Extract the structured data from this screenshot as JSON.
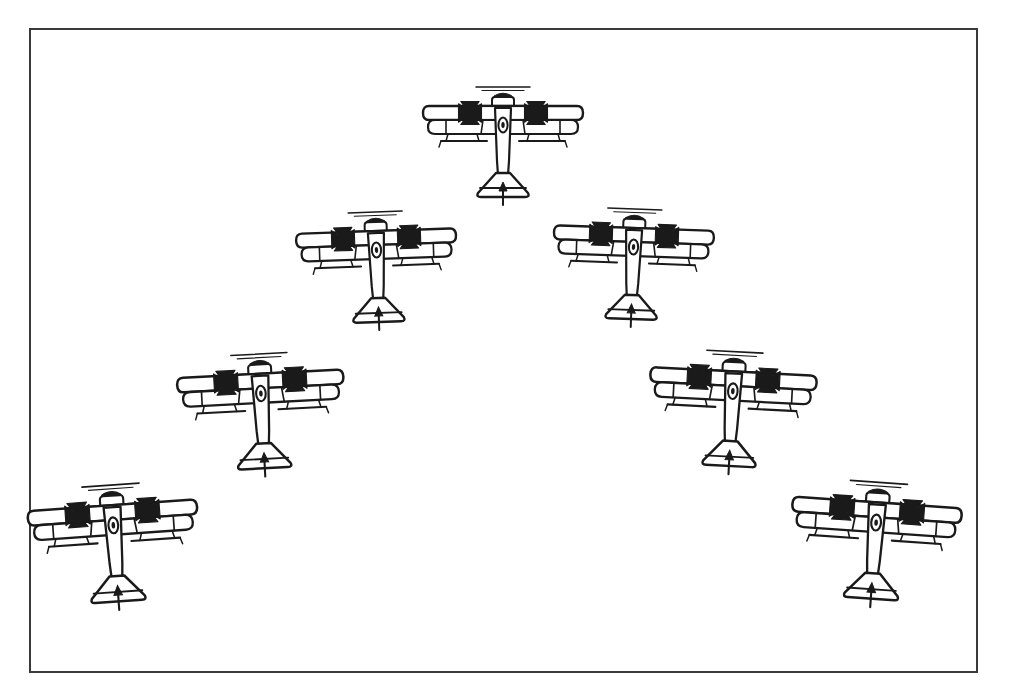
{
  "figure": {
    "kind": "line-drawing-diagram",
    "background_color": "#ffffff",
    "ink_color": "#1a1a1a",
    "frame": {
      "border_color": "#3a3a3a",
      "border_width_px": 2,
      "x": 29,
      "y": 28,
      "width": 949,
      "height": 645
    }
  },
  "diagram_data": {
    "type": "scatter",
    "title": "",
    "formation_name": "V / arrowhead (vic) formation",
    "unit_count": 7,
    "marking": "iron-cross",
    "aircraft_type": "biplane",
    "xlabel": "",
    "ylabel": "",
    "xlim": [
      29,
      978
    ],
    "ylim": [
      28,
      673
    ],
    "grid": false,
    "legend": "none",
    "units": [
      {
        "id": "lead",
        "label": "Lead aircraft",
        "row": 1,
        "cx": 503,
        "cy": 140,
        "scale": 1.0,
        "rotation_deg": 0
      },
      {
        "id": "left-wing-1",
        "label": "Left wingman 1",
        "row": 2,
        "cx": 377,
        "cy": 265,
        "scale": 1.0,
        "rotation_deg": -2
      },
      {
        "id": "right-wing-1",
        "label": "Right wingman 1",
        "row": 2,
        "cx": 633,
        "cy": 262,
        "scale": 1.0,
        "rotation_deg": 2
      },
      {
        "id": "left-wing-2",
        "label": "Left wingman 2",
        "row": 3,
        "cx": 265,
        "cy": 412,
        "scale": 1.04,
        "rotation_deg": -3
      },
      {
        "id": "right-wing-2",
        "label": "Right wingman 2",
        "row": 3,
        "cx": 735,
        "cy": 410,
        "scale": 1.04,
        "rotation_deg": 3
      },
      {
        "id": "left-wing-3",
        "label": "Left wingman 3",
        "row": 4,
        "cx": 120,
        "cy": 545,
        "scale": 1.06,
        "rotation_deg": -4
      },
      {
        "id": "right-wing-3",
        "label": "Right wingman 3",
        "row": 4,
        "cx": 880,
        "cy": 543,
        "scale": 1.06,
        "rotation_deg": 4
      }
    ],
    "aircraft_parts": [
      "propeller",
      "upper-wing",
      "lower-wing",
      "iron-cross-marking-left",
      "iron-cross-marking-right",
      "fuselage",
      "cockpit",
      "landing-gear-struts",
      "horizontal-stabilizer",
      "rudder"
    ]
  }
}
